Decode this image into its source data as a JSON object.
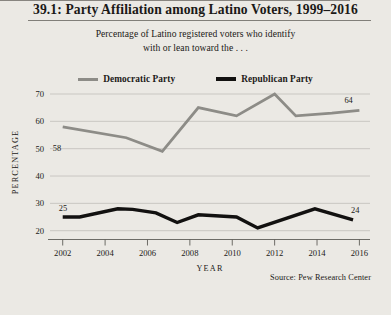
{
  "figure": {
    "title": "39.1: Party Affiliation among Latino Voters, 1999–2016",
    "subtitle_line1": "Percentage of Latino registered voters who identify",
    "subtitle_line2": "with or lean toward the . . .",
    "source": "Source:  Pew Research Center"
  },
  "legend": {
    "items": [
      {
        "label": "Democratic Party",
        "color": "#8d8c87",
        "swatch": "line-swatch-democratic"
      },
      {
        "label": "Republican Party",
        "color": "#121110",
        "swatch": "line-swatch-republican"
      }
    ]
  },
  "chart_data": {
    "type": "line",
    "title": "39.1: Party Affiliation among Latino Voters, 1999–2016",
    "subtitle": "Percentage of Latino registered voters who identify with or lean toward the . . .",
    "xlabel": "YEAR",
    "ylabel": "PERCENTAGE",
    "xlim": [
      2001.4,
      2016.5
    ],
    "ylim": [
      20,
      70
    ],
    "xticks": [
      2002,
      2004,
      2006,
      2008,
      2010,
      2012,
      2014,
      2016
    ],
    "xtick_labels": [
      "2002",
      "2004",
      "2006",
      "2008",
      "2010",
      "2012",
      "2014",
      "2016"
    ],
    "yticks": [
      20,
      30,
      40,
      50,
      60,
      70
    ],
    "ytick_labels": [
      "20",
      "30",
      "40",
      "50",
      "60",
      "70"
    ],
    "grid": "horizontal",
    "legend_position": "top-center",
    "series": [
      {
        "name": "Democratic Party",
        "color": "#8d8c87",
        "width": 2.8,
        "x": [
          2002,
          2005,
          2006.7,
          2008.4,
          2010.2,
          2012,
          2013,
          2014.7,
          2016
        ],
        "values": [
          58,
          54,
          49,
          65,
          62,
          70,
          62,
          63,
          64
        ],
        "point_labels": [
          {
            "x": 2002,
            "value": 58,
            "text": "58",
            "dx": -10,
            "dy": 24
          },
          {
            "x": 2016,
            "value": 64,
            "text": "64",
            "dx": -15,
            "dy": -7
          }
        ]
      },
      {
        "name": "Republican Party",
        "color": "#121110",
        "width": 3.4,
        "x": [
          2002,
          2002.8,
          2004.6,
          2005.3,
          2006.4,
          2007.4,
          2008.4,
          2010.2,
          2011.2,
          2013.9,
          2015.7
        ],
        "values": [
          25,
          25,
          28,
          27.8,
          26.5,
          23,
          25.8,
          25,
          21,
          28,
          24
        ],
        "point_labels": [
          {
            "x": 2002,
            "value": 25,
            "text": "25",
            "dx": -4,
            "dy": -6
          },
          {
            "x": 2015.7,
            "value": 24,
            "text": "24",
            "dx": -2,
            "dy": -7
          }
        ]
      }
    ]
  },
  "plot_geometry": {
    "left": 50,
    "right": 370,
    "top": 94,
    "bottom": 230.7,
    "axis_y": 239.5
  }
}
